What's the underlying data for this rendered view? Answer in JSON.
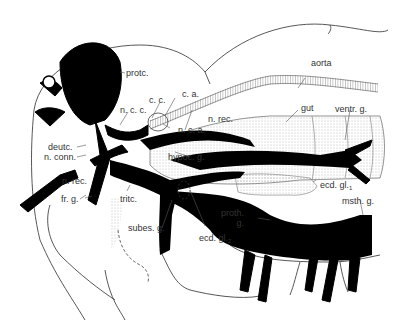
{
  "figure": {
    "labels": {
      "protc": "protc.",
      "ca": "c. a.",
      "cc": "c. c.",
      "ncc": "n. c. c.",
      "nca": "n. c. a.",
      "aorta": "aorta",
      "gut": "gut",
      "ventr_g": "ventr. g.",
      "n_rec_upper": "n. rec.",
      "deutc": "deutc.",
      "n_conn": "n. conn.",
      "hypoc_g": "hypoc. g.",
      "n_rec_lower": "n. rec.",
      "fr_g": "fr. g.",
      "tritc": "tritc.",
      "subes_g": "subes. g.",
      "ecd_gl1": "ecd. gl.",
      "ecd_gl1_sub": "1",
      "ecd_gl2": "ecd. gl.",
      "ecd_gl2_sub": "2",
      "proth_g_line1": "proth.",
      "proth_g_line2": "g.",
      "msth_g": "msth. g."
    }
  }
}
